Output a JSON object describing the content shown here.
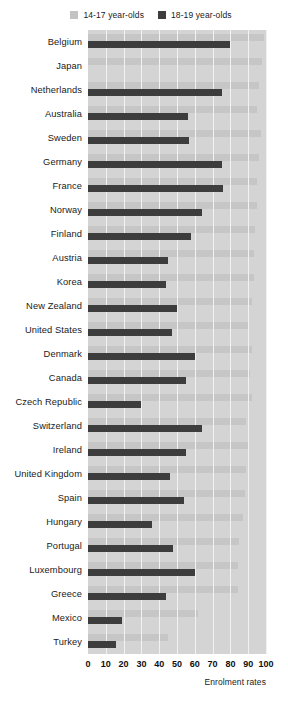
{
  "legend": {
    "position": "top-center",
    "items": [
      {
        "label": "14-17 year-olds",
        "color": "#c6c6c6",
        "key": "14-17"
      },
      {
        "label": "18-19 year-olds",
        "color": "#3d3d3d",
        "key": "18-19"
      }
    ]
  },
  "axis": {
    "xlabel": "Enrolment rates",
    "ticks": [
      "0",
      "10",
      "20",
      "30",
      "40",
      "50",
      "60",
      "70",
      "80",
      "90",
      "100"
    ]
  },
  "chart_data": {
    "type": "bar",
    "orientation": "horizontal",
    "title": "",
    "subtitle": "",
    "xlabel": "Enrolment rates",
    "ylabel": "",
    "xlim": [
      0,
      100
    ],
    "grid": true,
    "legend_position": "top-center",
    "tick_labels": [
      "0",
      "10",
      "20",
      "30",
      "40",
      "50",
      "60",
      "70",
      "80",
      "90",
      "100"
    ],
    "categories": [
      "Belgium",
      "Japan",
      "Netherlands",
      "Australia",
      "Sweden",
      "Germany",
      "France",
      "Norway",
      "Finland",
      "Austria",
      "Korea",
      "New Zealand",
      "United States",
      "Denmark",
      "Canada",
      "Czech Republic",
      "Switzerland",
      "Ireland",
      "United Kingdom",
      "Spain",
      "Hungary",
      "Portugal",
      "Luxembourg",
      "Greece",
      "Mexico",
      "Turkey"
    ],
    "series": [
      {
        "name": "14-17 year-olds",
        "color": "#c6c6c6",
        "values": [
          99,
          98,
          96,
          95,
          97,
          96,
          95,
          95,
          94,
          93,
          93,
          92,
          90,
          92,
          91,
          92,
          89,
          90,
          89,
          88,
          87,
          85,
          84,
          84,
          62,
          45
        ]
      },
      {
        "name": "18-19 year-olds",
        "color": "#3d3d3d",
        "values": [
          80,
          0,
          75,
          56,
          57,
          75,
          76,
          64,
          58,
          45,
          44,
          50,
          47,
          60,
          55,
          30,
          64,
          55,
          46,
          54,
          36,
          48,
          60,
          44,
          19,
          16
        ]
      }
    ]
  }
}
